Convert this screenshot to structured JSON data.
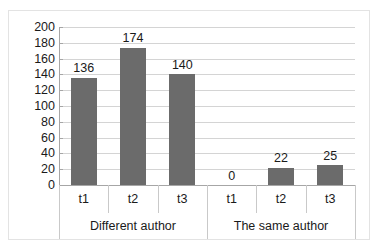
{
  "chart_data": {
    "type": "bar",
    "title": "",
    "subtitle": "",
    "xlabel": "",
    "ylabel": "",
    "ylim": [
      0,
      200
    ],
    "ytick_step": 20,
    "yticks": [
      "200",
      "180",
      "160",
      "140",
      "120",
      "100",
      "80",
      "60",
      "40",
      "20",
      "0"
    ],
    "grid": true,
    "grid_axis": "y",
    "legend": false,
    "legend_position": "none",
    "bar_color": "#6b6b6b",
    "categories": [
      "t1",
      "t2",
      "t3",
      "t1",
      "t2",
      "t3"
    ],
    "values": [
      136,
      174,
      140,
      0,
      22,
      25
    ],
    "data_labels": [
      "136",
      "174",
      "140",
      "0",
      "22",
      "25"
    ],
    "groups": [
      {
        "label": "Different author",
        "categories": [
          "t1",
          "t2",
          "t3"
        ],
        "values": [
          136,
          174,
          140
        ]
      },
      {
        "label": "The same author",
        "categories": [
          "t1",
          "t2",
          "t3"
        ],
        "values": [
          0,
          22,
          25
        ]
      }
    ],
    "series": [
      {
        "name": "",
        "values": [
          136,
          174,
          140,
          0,
          22,
          25
        ]
      }
    ]
  }
}
